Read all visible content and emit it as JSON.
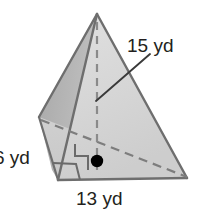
{
  "figure": {
    "name": "rectangular-pyramid",
    "labels": {
      "slant": "15 yd",
      "depth": "6 yd",
      "base": "13 yd"
    },
    "colors": {
      "front_face": "#d5d5d5",
      "left_face": "#b3b3b3",
      "back_left_face": "#c4c4c4",
      "base_face": "#cfcfcf",
      "outline": "#6e6e6e",
      "hidden_edge": "#7a7a7a",
      "leader_line": "#3a3a3a",
      "text": "#231f20",
      "center_dot": "#000000"
    },
    "geometry": {
      "apex": [
        97,
        14
      ],
      "front_left": [
        58,
        180
      ],
      "front_right": [
        187,
        178
      ],
      "rear_left": [
        39,
        117
      ],
      "center_point": [
        97,
        161
      ],
      "altitude_foot": [
        97,
        170
      ],
      "leader_end": [
        96,
        101
      ],
      "leader_start": [
        150,
        55
      ]
    },
    "markers": {
      "right_angle": "right-angle-marker",
      "center_dot": "center-point-dot",
      "base_angle": "base-angle-marker"
    }
  }
}
